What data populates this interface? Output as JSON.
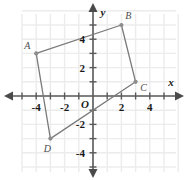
{
  "chart_data": {
    "type": "scatter",
    "title": "",
    "xlabel": "x",
    "ylabel": "y",
    "xlim": [
      -5,
      5
    ],
    "ylim": [
      -5,
      5
    ],
    "grid": true,
    "legend": "none",
    "x_ticks": [
      -4,
      -2,
      2,
      4
    ],
    "x_tick_labels": [
      "-4",
      "-2",
      "2",
      "4"
    ],
    "y_ticks": [
      4,
      2,
      -2,
      -4
    ],
    "y_tick_labels": [
      "4",
      "2",
      "-2",
      "-4"
    ],
    "origin_label": "O",
    "shape": {
      "name": "quadrilateral-ABCD",
      "closed": true,
      "vertices": [
        {
          "label": "A",
          "x": -4,
          "y": 3
        },
        {
          "label": "B",
          "x": 2,
          "y": 5
        },
        {
          "label": "C",
          "x": 3,
          "y": 1
        },
        {
          "label": "D",
          "x": -3,
          "y": -3
        }
      ],
      "stroke_color": "#7a7a7a",
      "vertex_color": "#8c8c8c"
    },
    "colors": {
      "grid": "#ececec",
      "axis": "#5a5a5a",
      "background": "#ffffff",
      "text": "#1a1a1a"
    }
  }
}
